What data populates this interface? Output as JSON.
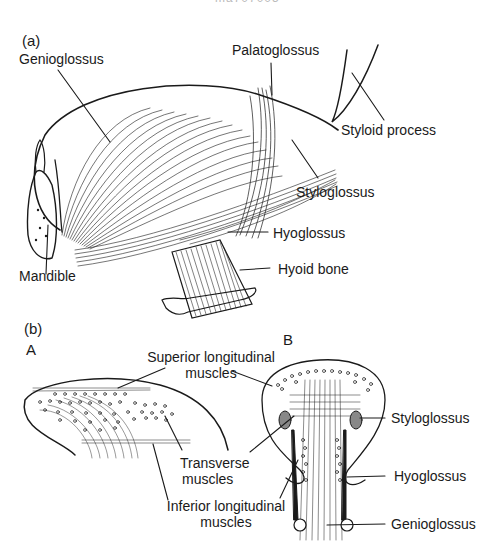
{
  "header": {
    "cut_text": "ma707005"
  },
  "panel_a": {
    "tag": "(a)",
    "labels": {
      "genioglossus": "Genioglossus",
      "palatoglossus": "Palatoglossus",
      "styloid_process": "Styloid process",
      "styloglossus": "Styloglossus",
      "hyoglossus": "Hyoglossus",
      "mandible": "Mandible",
      "hyoid_bone": "Hyoid bone"
    }
  },
  "panel_b": {
    "tag": "(b)",
    "sub_a": "A",
    "sub_b": "B",
    "labels": {
      "superior_longitudinal_1": "Superior longitudinal",
      "superior_longitudinal_2": "muscles",
      "transverse_1": "Transverse",
      "transverse_2": "muscles",
      "inferior_longitudinal_1": "Inferior longitudinal",
      "inferior_longitudinal_2": "muscles",
      "styloglossus": "Styloglossus",
      "hyoglossus": "Hyoglossus",
      "genioglossus": "Genioglossus"
    }
  },
  "colors": {
    "ink": "#1a1a1a",
    "background": "#ffffff"
  }
}
